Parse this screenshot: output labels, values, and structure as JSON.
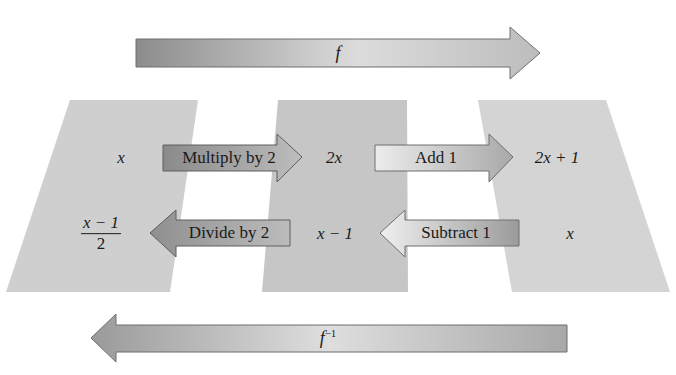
{
  "diagram": {
    "title": "",
    "colors": {
      "panel_left": "#cfcfcf",
      "panel_middle": "#c6c6c6",
      "panel_right": "#d4d4d4",
      "arrow_dark": "#8f8f8f",
      "arrow_light": "#e4e4e4",
      "text": "#1a1a1a"
    },
    "top_arrow": {
      "label": "f",
      "direction": "right"
    },
    "bottom_arrow": {
      "label_base": "f",
      "label_sup": "−1",
      "direction": "left"
    },
    "panels": [
      {
        "name": "domain-of-f",
        "top_value": "x",
        "bottom_value_num": "x − 1",
        "bottom_value_den": "2"
      },
      {
        "name": "intermediate",
        "top_value": "2x",
        "bottom_value": "x − 1"
      },
      {
        "name": "range-of-f",
        "top_value": "2x + 1",
        "bottom_value": "x"
      }
    ],
    "forward_steps": [
      {
        "label": "Multiply by 2",
        "direction": "right"
      },
      {
        "label": "Add 1",
        "direction": "right"
      }
    ],
    "inverse_steps": [
      {
        "label": "Divide by 2",
        "direction": "left"
      },
      {
        "label": "Subtract 1",
        "direction": "left"
      }
    ]
  }
}
